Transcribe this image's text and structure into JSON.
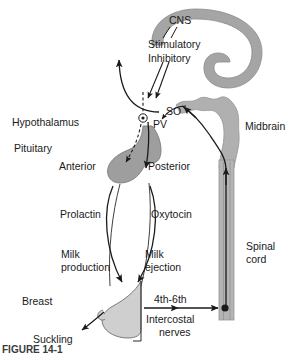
{
  "figure": {
    "caption_partial": "FIGURE 14-1",
    "colors": {
      "cns_gray": "#a5a5a5",
      "brainstem_gray": "#b0b0b0",
      "pituitary_gray": "#9e9e9e",
      "breast_gray": "#cfcfcf",
      "cord_gray": "#b4b4b4",
      "stroke": "#1a1a1a",
      "background": "#ffffff"
    }
  },
  "labels": {
    "cns": "CNS",
    "stimulatory": "Stimulatory",
    "inhibitory": "Inhibitory",
    "so": "SO",
    "pv": "PV",
    "hypothalamus": "Hypothalamus",
    "pituitary": "Pituitary",
    "anterior": "Anterior",
    "posterior": "Posterior",
    "midbrain": "Midbrain",
    "prolactin": "Prolactin",
    "oxytocin": "Oxytocin",
    "milk_production_1": "Milk",
    "milk_production_2": "production",
    "milk_ejection_1": "Milk",
    "milk_ejection_2": "ejection",
    "spinal_cord_1": "Spinal",
    "spinal_cord_2": "cord",
    "breast": "Breast",
    "suckling": "Suckling",
    "nerve_level": "4th-6th",
    "intercostal": "Intercostal",
    "nerves": "nerves"
  },
  "diagram_data": {
    "type": "anatomical-flow-diagram",
    "structures": [
      {
        "name": "CNS",
        "shape": "c-shaped-gyrus",
        "fill": "gray"
      },
      {
        "name": "midbrain-brainstem",
        "shape": "wavy-band",
        "fill": "gray"
      },
      {
        "name": "pituitary",
        "shape": "lobed-gland",
        "parts": [
          "Anterior",
          "Posterior"
        ],
        "fill": "gray"
      },
      {
        "name": "hypothalamic-nuclei",
        "parts": [
          "SO",
          "PV"
        ],
        "marker": "circle-with-dot"
      },
      {
        "name": "spinal-cord",
        "shape": "vertical-band",
        "fill": "gray"
      },
      {
        "name": "breast",
        "shape": "teardrop",
        "fill": "light-gray"
      }
    ],
    "pathways": [
      {
        "from": "CNS",
        "to": "hypothalamus",
        "label": "Stimulatory",
        "style": "solid-arrow"
      },
      {
        "from": "CNS",
        "to": "hypothalamus",
        "label": "Inhibitory",
        "style": "solid-arrow"
      },
      {
        "from": "hypothalamus",
        "to": "CNS",
        "label": "ascending",
        "style": "curved-arrow"
      },
      {
        "from": "hypothalamus",
        "to": "anterior-pituitary",
        "style": "dashed-arrow"
      },
      {
        "from": "PV",
        "to": "posterior-pituitary",
        "style": "solid-arrow"
      },
      {
        "from": "anterior-pituitary",
        "to": "breast",
        "label": "Prolactin",
        "effect": "Milk production"
      },
      {
        "from": "posterior-pituitary",
        "to": "breast",
        "label": "Oxytocin",
        "effect": "Milk ejection"
      },
      {
        "from": "breast",
        "to": "spinal-cord",
        "label": "4th-6th Intercostal nerves",
        "style": "afferent-arrows"
      },
      {
        "from": "spinal-cord",
        "to": "midbrain",
        "style": "ascending-arrow"
      },
      {
        "from": "nipple",
        "to": "suckling-label",
        "label": "Suckling",
        "style": "curved-arrow"
      }
    ]
  }
}
